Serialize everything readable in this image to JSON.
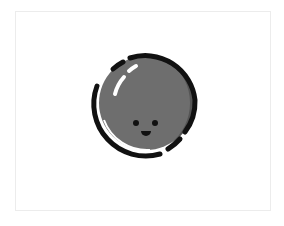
{
  "illustration": {
    "subject": "smiling-ball-icon",
    "colors": {
      "background": "#ffffff",
      "frame_border": "#ececec",
      "ball_fill": "#6e6e6e",
      "ball_shadow": "#555555",
      "outline": "#111111",
      "highlight": "#ffffff",
      "face": "#111111"
    }
  }
}
